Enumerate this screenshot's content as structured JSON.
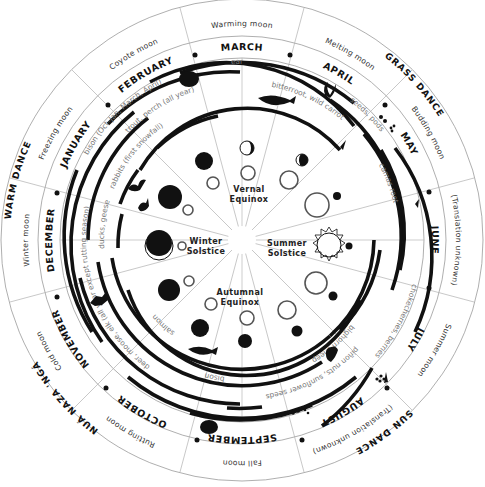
{
  "diagram": {
    "type": "seasonal round calendar (circular)",
    "months": [
      {
        "name": "MARCH",
        "angle": 0
      },
      {
        "name": "APRIL",
        "angle": 30
      },
      {
        "name": "MAY",
        "angle": 60
      },
      {
        "name": "JUNE",
        "angle": 90
      },
      {
        "name": "JULY",
        "angle": 120
      },
      {
        "name": "AUGUST",
        "angle": 150
      },
      {
        "name": "SEPTEMBER",
        "angle": 180
      },
      {
        "name": "OCTOBER",
        "angle": 210
      },
      {
        "name": "NOVEMBER",
        "angle": 240
      },
      {
        "name": "DECEMBER",
        "angle": 270
      },
      {
        "name": "JANUARY",
        "angle": 300
      },
      {
        "name": "FEBRUARY",
        "angle": 330
      }
    ],
    "moons": [
      {
        "name": "Warming moon",
        "month": "MARCH"
      },
      {
        "name": "Melting moon",
        "month": "APRIL"
      },
      {
        "name": "Budding moon",
        "month": "MAY"
      },
      {
        "name": "(Translation unknown)",
        "month": "JUNE"
      },
      {
        "name": "Summer moon",
        "month": "JULY"
      },
      {
        "name": "(Translation unknown)",
        "month": "AUGUST"
      },
      {
        "name": "Fall moon",
        "month": "SEPTEMBER"
      },
      {
        "name": "Rutting moon",
        "month": "OCTOBER"
      },
      {
        "name": "Cold moon",
        "month": "NOVEMBER"
      },
      {
        "name": "Winter moon",
        "month": "DECEMBER"
      },
      {
        "name": "Freezing moon",
        "month": "JANUARY"
      },
      {
        "name": "Coyote moon",
        "month": "FEBRUARY"
      }
    ],
    "ceremonies": [
      {
        "name": "GRASS DANCE",
        "angle": 45
      },
      {
        "name": "SUN DANCE",
        "angle": 135
      },
      {
        "name": "NUÁ NAZA 'NGÁ",
        "angle": 225
      },
      {
        "name": "WARM DANCE",
        "angle": 285
      }
    ],
    "resources": [
      {
        "label": "early greens, watercress sprouts",
        "icon": "plant-sprout-icon"
      },
      {
        "label": "seeds, pods",
        "icon": "seeds-icon"
      },
      {
        "label": "bitterroot, wild carrot",
        "icon": "root-icon"
      },
      {
        "label": "camas root",
        "icon": "root-icon"
      },
      {
        "label": "trout, perch (all year)",
        "icon": "fish-icon"
      },
      {
        "label": "chokecherries, berries",
        "icon": "berries-icon"
      },
      {
        "label": "bighorn sheep",
        "icon": "sheep-icon"
      },
      {
        "label": "piñon nuts, sunflower seeds",
        "icon": "nuts-icon"
      },
      {
        "label": "bison",
        "icon": "bison-icon"
      },
      {
        "label": "salmon",
        "icon": "salmon-icon"
      },
      {
        "label": "deer, moose, elk (all year except rutting season)",
        "icon": "deer-icon"
      },
      {
        "label": "ducks, geese",
        "icon": "bird-icon"
      },
      {
        "label": "rabbits (first snowfall)",
        "icon": "rabbit-icon"
      },
      {
        "label": "bison (Oct–Jan, March, April)",
        "icon": "bison-icon"
      }
    ],
    "events": {
      "vernal": [
        "Vernal",
        "Equinox"
      ],
      "summer": [
        "Summer",
        "Solstice"
      ],
      "autumnal": [
        "Autumnal",
        "Equinox"
      ],
      "winter": [
        "Winter",
        "Solstice"
      ]
    }
  }
}
